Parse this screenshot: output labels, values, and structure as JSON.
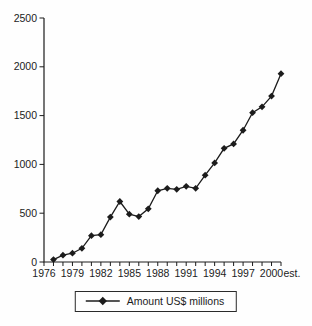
{
  "chart_data": {
    "type": "line",
    "title": "",
    "xlabel": "",
    "ylabel": "",
    "x": [
      1977,
      1978,
      1979,
      1980,
      1981,
      1982,
      1983,
      1984,
      1985,
      1986,
      1987,
      1988,
      1989,
      1990,
      1991,
      1992,
      1993,
      1994,
      1995,
      1996,
      1997,
      1998,
      1999,
      2000,
      2001
    ],
    "series": [
      {
        "name": "Amount US$ millions",
        "values": [
          25,
          70,
          90,
          140,
          270,
          280,
          460,
          620,
          490,
          465,
          545,
          730,
          755,
          745,
          775,
          755,
          890,
          1015,
          1165,
          1210,
          1350,
          1530,
          1590,
          1700,
          1930
        ]
      }
    ],
    "ylim": [
      0,
      2500
    ],
    "y_ticks": [
      0,
      500,
      1000,
      1500,
      2000,
      2500
    ],
    "x_axis_range": [
      1976,
      2001
    ],
    "x_labeled_ticks": [
      1976,
      1979,
      1982,
      1985,
      1988,
      1991,
      1994,
      1997,
      2000
    ],
    "x_extra_label": "est.",
    "grid": false,
    "marker": "diamond",
    "line_color": "#1c1c1c",
    "legend_position": "bottom-center"
  },
  "legend": {
    "label": "Amount US$ millions"
  }
}
